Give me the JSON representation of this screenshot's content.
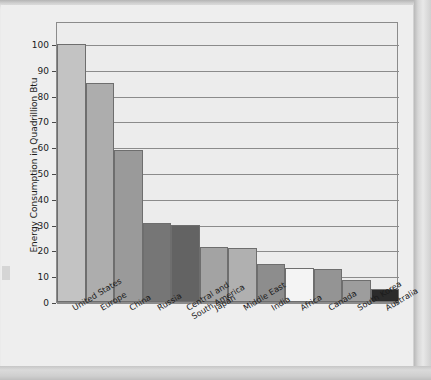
{
  "chart_data": {
    "type": "bar",
    "title": "Energy Consumption Per Year",
    "xlabel": "",
    "ylabel": "Energy Consumption in Quadrillion Btu",
    "ylim": [
      0,
      105
    ],
    "grid": true,
    "legend": "none",
    "ytick_labels": [
      "100",
      "90",
      "80",
      "70",
      "60",
      "50",
      "40",
      "30",
      "20",
      "10",
      "0"
    ],
    "ytick_values": [
      100,
      90,
      80,
      70,
      60,
      50,
      40,
      30,
      20,
      10,
      0
    ],
    "categories": [
      "United States",
      "Europe",
      "China",
      "Russia",
      "Central and\nSouth America",
      "Japan",
      "Middle East",
      "India",
      "Africa",
      "Canada",
      "South Korea",
      "Australia"
    ],
    "values": [
      100,
      85,
      59,
      30.5,
      29.8,
      21.5,
      21,
      14.8,
      13.2,
      12.8,
      8.7,
      5
    ],
    "bar_colors": [
      "#c3c3c3",
      "#adadad",
      "#9a9a9a",
      "#767676",
      "#636363",
      "#a3a3a3",
      "#b0b0b0",
      "#8d8d8d",
      "#f4f4f4",
      "#949494",
      "#9d9d9d",
      "#2b2b2b"
    ]
  },
  "colors": {
    "plot_background": "#ececec",
    "gridline": "#8b8b8b",
    "frame": "#8b8b8b",
    "text": "#1b1b1b",
    "page_background": "#eeeeee"
  }
}
